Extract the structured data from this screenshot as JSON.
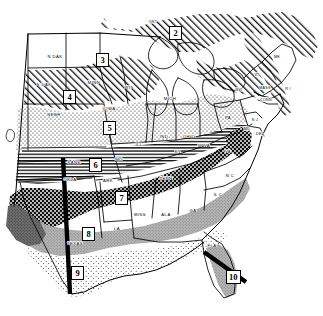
{
  "map": {
    "title": "Eastern United States zone map",
    "colors": {
      "ink": "#000000",
      "paper": "#ffffff",
      "light_gray": "#b9b9b9",
      "mid_gray": "#8a8a8a",
      "dark_gray": "#4a4a4a"
    },
    "zones": [
      {
        "id": "zone-2",
        "label": "2",
        "x": 169,
        "y": 26,
        "pattern": "diagonal-hatch"
      },
      {
        "id": "zone-3",
        "label": "3",
        "x": 96,
        "y": 53,
        "pattern": "blank"
      },
      {
        "id": "zone-4",
        "label": "4",
        "x": 63,
        "y": 90,
        "pattern": "diagonal-hatch"
      },
      {
        "id": "zone-5",
        "label": "5",
        "x": 103,
        "y": 121,
        "pattern": "stipple-fine"
      },
      {
        "id": "zone-6",
        "label": "6",
        "x": 89,
        "y": 158,
        "pattern": "horizontal-lines"
      },
      {
        "id": "zone-7",
        "label": "7",
        "x": 115,
        "y": 191,
        "pattern": "dark-crosshatch"
      },
      {
        "id": "zone-8",
        "label": "8",
        "x": 82,
        "y": 227,
        "pattern": "solid-gray"
      },
      {
        "id": "zone-9",
        "label": "9",
        "x": 71,
        "y": 266,
        "pattern": "stipple-light"
      },
      {
        "id": "zone-10",
        "label": "10",
        "x": 226,
        "y": 270,
        "pattern": "solid-gray"
      }
    ],
    "states": [
      {
        "abbr": "N DAK",
        "x": 55,
        "y": 56
      },
      {
        "abbr": "S DAK",
        "x": 44,
        "y": 84
      },
      {
        "abbr": "NEBR",
        "x": 54,
        "y": 114
      },
      {
        "abbr": "MINN",
        "x": 94,
        "y": 82
      },
      {
        "abbr": "WIS",
        "x": 129,
        "y": 87
      },
      {
        "abbr": "IOWA",
        "x": 109,
        "y": 108
      },
      {
        "abbr": "MICH",
        "x": 170,
        "y": 98
      },
      {
        "abbr": "ILL",
        "x": 139,
        "y": 144
      },
      {
        "abbr": "IND",
        "x": 164,
        "y": 136
      },
      {
        "abbr": "OHIO",
        "x": 189,
        "y": 136
      },
      {
        "abbr": "MO",
        "x": 119,
        "y": 159
      },
      {
        "abbr": "KANS",
        "x": 74,
        "y": 162
      },
      {
        "abbr": "OKLA",
        "x": 70,
        "y": 179
      },
      {
        "abbr": "ARK",
        "x": 108,
        "y": 180
      },
      {
        "abbr": "KY",
        "x": 178,
        "y": 151
      },
      {
        "abbr": "W VA",
        "x": 204,
        "y": 145
      },
      {
        "abbr": "VA",
        "x": 228,
        "y": 151
      },
      {
        "abbr": "TENN",
        "x": 166,
        "y": 178
      },
      {
        "abbr": "N C",
        "x": 230,
        "y": 175
      },
      {
        "abbr": "S C",
        "x": 218,
        "y": 194
      },
      {
        "abbr": "MISS",
        "x": 140,
        "y": 214
      },
      {
        "abbr": "ALA",
        "x": 166,
        "y": 214
      },
      {
        "abbr": "GA",
        "x": 193,
        "y": 210
      },
      {
        "abbr": "LA",
        "x": 117,
        "y": 228
      },
      {
        "abbr": "TEXAS",
        "x": 75,
        "y": 243
      },
      {
        "abbr": "FLA",
        "x": 212,
        "y": 245
      },
      {
        "abbr": "PA",
        "x": 228,
        "y": 117
      },
      {
        "abbr": "N Y",
        "x": 239,
        "y": 90
      },
      {
        "abbr": "MD",
        "x": 247,
        "y": 129
      },
      {
        "abbr": "DEL",
        "x": 258,
        "y": 134
      },
      {
        "abbr": "N J",
        "x": 255,
        "y": 120
      },
      {
        "abbr": "CONN",
        "x": 265,
        "y": 100
      },
      {
        "abbr": "MASS",
        "x": 265,
        "y": 88
      },
      {
        "abbr": "R I",
        "x": 285,
        "y": 89
      },
      {
        "abbr": "VT",
        "x": 257,
        "y": 75
      },
      {
        "abbr": "ME",
        "x": 277,
        "y": 57
      },
      {
        "abbr": "ONT",
        "x": 153,
        "y": 22
      }
    ],
    "markers": [
      {
        "name": "vertical-bar",
        "description": "thick black vertical bar through Texas and Oklahoma"
      },
      {
        "name": "diagonal-bar",
        "description": "thick black diagonal bar crossing Florida at zone 10"
      }
    ]
  }
}
